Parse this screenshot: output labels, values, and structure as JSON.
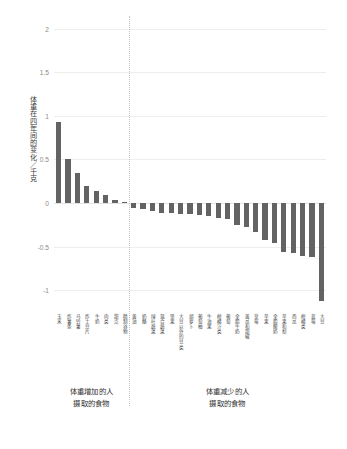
{
  "chart": {
    "type": "bar",
    "ylabel": "体重在四年间的变化／千克",
    "xlabel": "",
    "title": "",
    "grid": true,
    "legend": false,
    "ylim": [
      -1.25,
      2.1
    ],
    "yticks": [
      "2",
      "1.5",
      "1",
      "0.5",
      "0",
      "-0.5",
      "-1"
    ],
    "ytick_values": [
      2,
      1.5,
      1,
      0.5,
      0,
      -0.5,
      -1
    ],
    "bar_color": "#636363",
    "gridline_color": "#eeeeee",
    "separator_after_index": 7,
    "categories": [
      "玉米",
      "炸薯条",
      "马铃薯",
      "炸土豆片",
      "牛奶",
      "肉类",
      "甜点",
      "精制谷物"
    ],
    "negative_categories": [
      "黄油",
      "奶酪",
      "绿叶蔬菜",
      "混合蔬菜",
      "坚果",
      "大豆以外的豆类",
      "胡萝卜",
      "葡萄柚",
      "牛油果",
      "柑橘汁类",
      "葡萄",
      "全脂牛奶",
      "黄瓜和甜椒",
      "草莓",
      "苹果",
      "全脂酸奶",
      "苹果和梨",
      "西瓜",
      "柑橘类",
      "蓝莓",
      "大豆"
    ],
    "all_categories": [
      "玉米",
      "炸薯条",
      "马铃薯",
      "炸土豆片",
      "牛奶",
      "肉类",
      "甜点",
      "精制谷物",
      "黄油",
      "奶酪",
      "绿叶蔬菜",
      "混合蔬菜",
      "坚果",
      "大豆以外的豆类",
      "胡萝卜",
      "葡萄柚",
      "牛油果",
      "柑橘汁类",
      "葡萄",
      "全脂牛奶",
      "黄瓜和甜椒",
      "草莓",
      "苹果",
      "全脂酸奶",
      "苹果和梨",
      "西瓜",
      "柑橘类",
      "蓝莓",
      "大豆"
    ],
    "values": [
      0.93,
      0.51,
      0.34,
      0.19,
      0.14,
      0.09,
      0.03,
      0.01,
      -0.06,
      -0.07,
      -0.09,
      -0.11,
      -0.12,
      -0.13,
      -0.13,
      -0.14,
      -0.15,
      -0.17,
      -0.18,
      -0.25,
      -0.27,
      -0.33,
      -0.42,
      -0.46,
      -0.56,
      -0.57,
      -0.61,
      -0.62,
      -1.12
    ]
  },
  "annotations": {
    "left": {
      "line1": "体重增加的人",
      "line2": "摄取的食物"
    },
    "right": {
      "line1": "体重减少的人",
      "line2": "摄取的食物"
    }
  }
}
